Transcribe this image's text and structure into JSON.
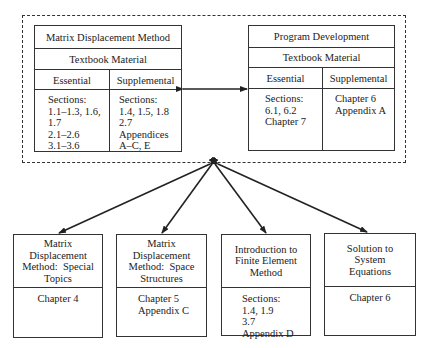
{
  "top_group": {
    "left_table": {
      "title": "Matrix Displacement Method",
      "subtitle": "Textbook Material",
      "col_essential": "Essential",
      "col_supplemental": "Supplemental",
      "essential_content": "Sections:\n1.1–1.3, 1.6,\n1.7\n2.1–2.6\n3.1–3.6",
      "supplemental_content": "Sections:\n1.4, 1.5, 1.8\n2.7\nAppendices\nA–C, E"
    },
    "right_table": {
      "title": "Program Development",
      "subtitle": "Textbook Material",
      "col_essential": "Essential",
      "col_supplemental": "Supplemental",
      "essential_content": "Sections:\n6.1, 6.2\nChapter 7",
      "supplemental_content": "Chapter 6\nAppendix A"
    }
  },
  "bottom_boxes": [
    {
      "title": "Matrix\nDisplacement\nMethod:  Special\nTopics",
      "content": "Chapter 4"
    },
    {
      "title": "Matrix\nDisplacement\nMethod:  Space\nStructures",
      "content": "Chapter 5\nAppendix C"
    },
    {
      "title": "Introduction to\nFinite Element\nMethod",
      "content": "Sections:\n1.4, 1.9\n3.7\nAppendix D"
    },
    {
      "title": "Solution to\nSystem\nEquations",
      "content": "Chapter 6"
    }
  ],
  "colors": {
    "line": "#333333",
    "background": "#ffffff"
  }
}
